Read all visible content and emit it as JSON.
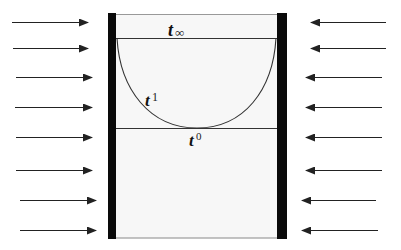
{
  "diagram": {
    "type": "physics-container-meniscus",
    "colors": {
      "background": "#ffffff",
      "wall": "#0a0a0a",
      "interior": "#f7f7f7",
      "line": "#333333",
      "arrow": "#222222"
    },
    "labels": {
      "t_inf": {
        "base": "t",
        "subscript": "∞"
      },
      "t_1": {
        "base": "t",
        "subscript": "1"
      },
      "t_0": {
        "base": "t",
        "subscript": "0"
      }
    },
    "left_arrows": [
      {
        "y": 22,
        "x1": 12,
        "x2": 88
      },
      {
        "y": 48,
        "x1": 13,
        "x2": 88
      },
      {
        "y": 77,
        "x1": 16,
        "x2": 92
      },
      {
        "y": 107,
        "x1": 15,
        "x2": 92
      },
      {
        "y": 137,
        "x1": 16,
        "x2": 92
      },
      {
        "y": 170,
        "x1": 16,
        "x2": 92
      },
      {
        "y": 200,
        "x1": 20,
        "x2": 96
      },
      {
        "y": 230,
        "x1": 20,
        "x2": 96
      }
    ],
    "right_arrows": [
      {
        "y": 22,
        "x1": 386,
        "x2": 311
      },
      {
        "y": 48,
        "x1": 386,
        "x2": 311
      },
      {
        "y": 77,
        "x1": 382,
        "x2": 306
      },
      {
        "y": 107,
        "x1": 382,
        "x2": 306
      },
      {
        "y": 137,
        "x1": 382,
        "x2": 306
      },
      {
        "y": 170,
        "x1": 382,
        "x2": 306
      },
      {
        "y": 200,
        "x1": 376,
        "x2": 302
      },
      {
        "y": 230,
        "x1": 378,
        "x2": 302
      }
    ]
  }
}
